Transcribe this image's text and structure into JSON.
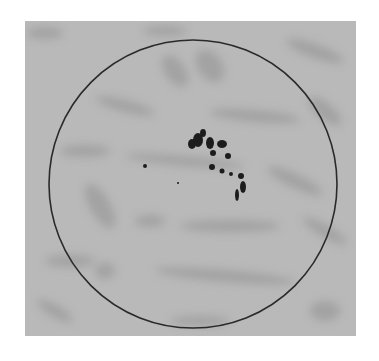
{
  "image": {
    "description": "Grayscale photograph of a circular field of view with a cluster of dark spots over a blurred handwritten-text background",
    "background_color": "#b9b9b9",
    "circle": {
      "cx": 168,
      "cy": 163,
      "r": 144,
      "stroke": "#2a2a2a"
    },
    "spot_color": "#1e1e1e",
    "spots": [
      {
        "cx": 173,
        "cy": 119,
        "rx": 5,
        "ry": 7
      },
      {
        "cx": 167,
        "cy": 123,
        "rx": 4,
        "ry": 5
      },
      {
        "cx": 178,
        "cy": 112,
        "rx": 3,
        "ry": 4
      },
      {
        "cx": 185,
        "cy": 122,
        "rx": 4,
        "ry": 6
      },
      {
        "cx": 197,
        "cy": 123,
        "rx": 5,
        "ry": 4
      },
      {
        "cx": 188,
        "cy": 132,
        "rx": 3,
        "ry": 3
      },
      {
        "cx": 203,
        "cy": 135,
        "rx": 3,
        "ry": 3
      },
      {
        "cx": 187,
        "cy": 146,
        "rx": 3,
        "ry": 3
      },
      {
        "cx": 197,
        "cy": 150,
        "rx": 2.5,
        "ry": 2.5
      },
      {
        "cx": 206,
        "cy": 153,
        "rx": 2,
        "ry": 2
      },
      {
        "cx": 216,
        "cy": 155,
        "rx": 3,
        "ry": 3
      },
      {
        "cx": 218,
        "cy": 166,
        "rx": 3,
        "ry": 6
      },
      {
        "cx": 212,
        "cy": 174,
        "rx": 2,
        "ry": 6
      },
      {
        "cx": 120,
        "cy": 145,
        "rx": 2,
        "ry": 2
      },
      {
        "cx": 153,
        "cy": 162,
        "rx": 1,
        "ry": 1
      }
    ]
  }
}
